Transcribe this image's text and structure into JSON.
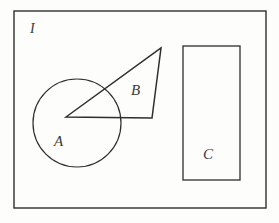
{
  "figure": {
    "background_color": "#fdfdfc",
    "stroke_color": "#2e2e2e",
    "label_color": "#3a3a3a",
    "canvas": {
      "width": 279,
      "height": 223
    },
    "universal_set": {
      "label": "I",
      "shape": "rectangle",
      "x": 14,
      "y": 11,
      "width": 252,
      "height": 197,
      "label_x": 30,
      "label_y": 33,
      "stroke_width": 1.4,
      "fill": "none"
    },
    "shapes": [
      {
        "id": "A",
        "label": "A",
        "type": "circle",
        "cx": 77,
        "cy": 123,
        "r": 44,
        "label_x": 54,
        "label_y": 146,
        "stroke_width": 1.2,
        "fill": "none"
      },
      {
        "id": "B",
        "label": "B",
        "type": "triangle",
        "points": "66,117 161,48 152,118",
        "vertices": [
          {
            "x": 66,
            "y": 117
          },
          {
            "x": 161,
            "y": 48
          },
          {
            "x": 152,
            "y": 118
          }
        ],
        "label_x": 131,
        "label_y": 95,
        "stroke_width": 1.5,
        "fill": "none"
      },
      {
        "id": "C",
        "label": "C",
        "type": "rectangle",
        "x": 183,
        "y": 46,
        "width": 57,
        "height": 134,
        "label_x": 203,
        "label_y": 159,
        "stroke_width": 1.3,
        "fill": "none"
      }
    ],
    "label_font_size": 15,
    "universal_label_font_size": 14
  }
}
